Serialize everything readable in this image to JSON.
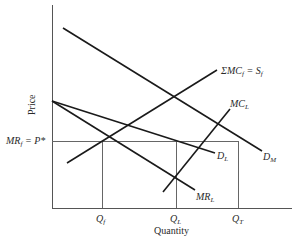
{
  "diagram": {
    "type": "economics-supply-demand",
    "axes": {
      "y_label": "Price",
      "x_label": "Quantity"
    },
    "price_level": {
      "label_main": "MR",
      "label_sub": "f",
      "label_rest": " = P*"
    },
    "quantity_ticks": [
      {
        "main": "Q",
        "sub": "f"
      },
      {
        "main": "Q",
        "sub": "L"
      },
      {
        "main": "Q",
        "sub": "T"
      }
    ],
    "curves": {
      "market_demand": {
        "main": "D",
        "sub": "M"
      },
      "leader_demand": {
        "main": "D",
        "sub": "L"
      },
      "leader_marginal_revenue": {
        "main": "MR",
        "sub": "L"
      },
      "leader_marginal_cost": {
        "main": "MC",
        "sub": "L"
      },
      "fringe_supply": {
        "main": "ΣMC",
        "sub": "f",
        "rest": " = S",
        "sub2": "f"
      }
    },
    "colors": {
      "curve": "#1a1a1a",
      "axis": "#555555",
      "guide": "#666666",
      "text": "#2a2a2a"
    }
  }
}
